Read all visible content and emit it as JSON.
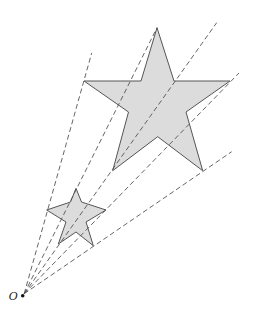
{
  "diagram": {
    "title": "",
    "colors": {
      "star_fill": "#dcdcdc",
      "stroke": "#555555",
      "ray": "#555555",
      "background": "#ffffff"
    },
    "center": {
      "label": "O",
      "x": 22.7,
      "y": 295.7
    },
    "small_star": {
      "points": [
        [
          76,
          188.3
        ],
        [
          81.5,
          202
        ],
        [
          106,
          210
        ],
        [
          86,
          222
        ],
        [
          93.3,
          245.7
        ],
        [
          76,
          232
        ],
        [
          58.3,
          244
        ],
        [
          66,
          222
        ],
        [
          46.7,
          210
        ],
        [
          70.5,
          202
        ]
      ]
    },
    "large_star": {
      "points": [
        [
          157,
          27.7
        ],
        [
          174,
          81
        ],
        [
          230,
          81
        ],
        [
          186,
          112
        ],
        [
          202.7,
          170.7
        ],
        [
          157.7,
          136.7
        ],
        [
          112.7,
          170.7
        ],
        [
          128.5,
          112
        ],
        [
          84,
          81
        ],
        [
          141,
          81
        ]
      ]
    },
    "rays": [
      {
        "to": [
          91.7,
          53
        ]
      },
      {
        "to": [
          157,
          27.7
        ]
      },
      {
        "to": [
          216.7,
          22.7
        ]
      },
      {
        "to": [
          239,
          73
        ]
      },
      {
        "to": [
          231.7,
          151.7
        ]
      }
    ]
  }
}
